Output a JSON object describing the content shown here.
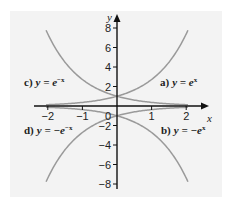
{
  "chart_data": {
    "type": "line",
    "title": "",
    "xlabel": "x",
    "ylabel": "y",
    "xlim": [
      -2.4,
      2.5
    ],
    "ylim": [
      -9,
      9
    ],
    "x_ticks": [
      -2,
      -1,
      0,
      1,
      2
    ],
    "x_tick_labels": [
      "−2",
      "−1",
      "0",
      "1",
      "2"
    ],
    "y_ticks": [
      -8,
      -6,
      -4,
      -2,
      2,
      4,
      6,
      8
    ],
    "y_tick_labels": [
      "−8",
      "−6",
      "−4",
      "−2",
      "2",
      "4",
      "6",
      "8"
    ],
    "grid": false,
    "curve_x_range": [
      -2.05,
      2.05
    ],
    "curve_color": "#9a9a9a",
    "series": [
      {
        "id": "a",
        "name": "a) y = e^x",
        "label_prefix": "a)",
        "label_expr": "y = e",
        "label_exp": "x",
        "fn": "exp(x)"
      },
      {
        "id": "b",
        "name": "b) y = −e^x",
        "label_prefix": "b)",
        "label_expr": "y = −e",
        "label_exp": "x",
        "fn": "-exp(x)"
      },
      {
        "id": "c",
        "name": "c) y = e^−x",
        "label_prefix": "c)",
        "label_expr": "y = e",
        "label_exp": "−x",
        "fn": "exp(-x)"
      },
      {
        "id": "d",
        "name": "d) y = −e^−x",
        "label_prefix": "d)",
        "label_expr": "y = −e",
        "label_exp": "−x",
        "fn": "-exp(-x)"
      }
    ]
  },
  "labels": {
    "a_prefix": "a)",
    "a_expr": "y = e",
    "a_exp": "x",
    "b_prefix": "b)",
    "b_expr": "y = −e",
    "b_exp": "x",
    "c_prefix": "c)",
    "c_expr": "y = e",
    "c_exp": "−x",
    "d_prefix": "d)",
    "d_expr": "y = −e",
    "d_exp": "−x",
    "x_axis": "x",
    "y_axis": "y"
  }
}
